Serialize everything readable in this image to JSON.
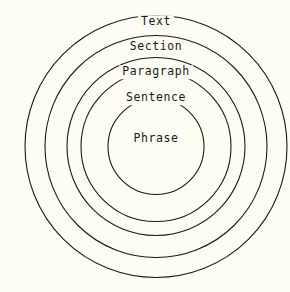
{
  "diagram": {
    "type": "concentric-circles",
    "title": "",
    "background_color": "#fdfdf4",
    "stroke_color": "#1a1a1a",
    "text_color": "#1a1a1a",
    "center": {
      "x": 156,
      "y": 146.5
    },
    "rings": [
      {
        "label": "Text",
        "level": 1,
        "radius": 131,
        "label_x": 156,
        "label_y": 22
      },
      {
        "label": "Section",
        "level": 2,
        "radius": 111,
        "label_x": 156,
        "label_y": 47
      },
      {
        "label": "Paragraph",
        "level": 3,
        "radius": 89,
        "label_x": 156,
        "label_y": 72
      },
      {
        "label": "Sentence",
        "level": 4,
        "radius": 75,
        "label_x": 156,
        "label_y": 98
      },
      {
        "label": "Phrase",
        "level": 5,
        "radius": 48,
        "label_x": 156,
        "label_y": 139
      }
    ]
  }
}
